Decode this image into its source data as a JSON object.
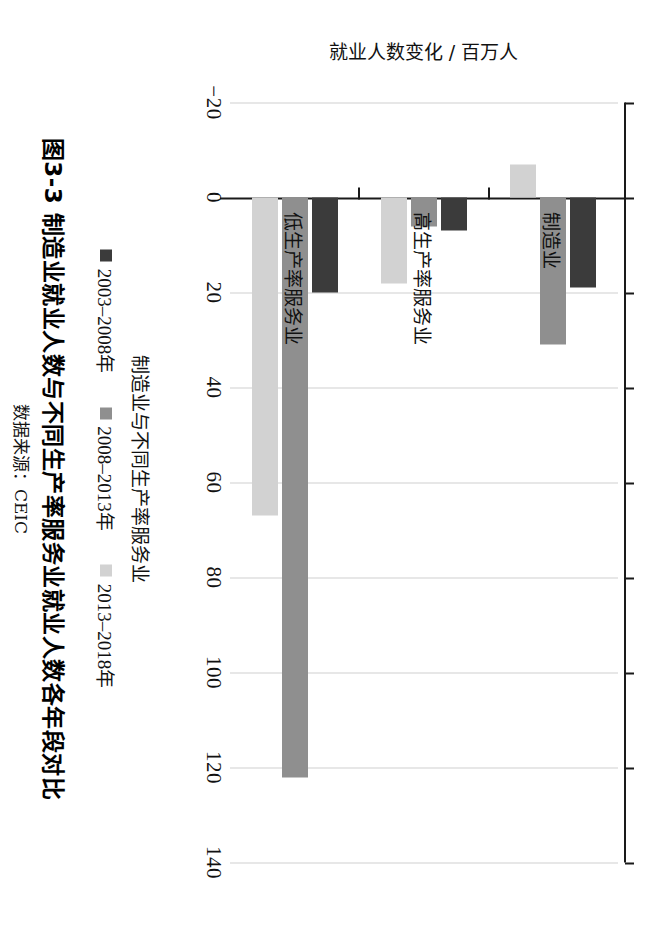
{
  "figure": {
    "number": "图3-3",
    "title": "图3-3  制造业就业人数与不同生产率服务业就业人数各年段对比",
    "source": "数据来源：CEIC"
  },
  "chart_data": {
    "type": "bar",
    "orientation": "vertical",
    "title": "制造业就业人数与不同生产率服务业就业人数各年段对比",
    "xlabel": "制造业与不同生产率服务业",
    "ylabel": "就业人数变化 / 百万人",
    "categories": [
      "制造业",
      "高生产率服务业",
      "低生产率服务业"
    ],
    "series": [
      {
        "name": "2003–2008年",
        "color": "#3b3b3b",
        "values": [
          19,
          7,
          20
        ]
      },
      {
        "name": "2008–2013年",
        "color": "#8f8f8f",
        "values": [
          31,
          6,
          122
        ]
      },
      {
        "name": "2013–2018年",
        "color": "#d2d2d2",
        "values": [
          -7,
          18,
          67
        ]
      }
    ],
    "ylim": [
      -20,
      140
    ],
    "yticks": [
      -20,
      0,
      20,
      40,
      60,
      80,
      100,
      120,
      140
    ],
    "ytick_labels": [
      "−20",
      "0",
      "20",
      "40",
      "60",
      "80",
      "100",
      "120",
      "140"
    ],
    "grid": true,
    "legend_position": "bottom"
  },
  "axis": {
    "value_axis_title": "就业人数变化 / 百万人",
    "category_axis_title": "制造业与不同生产率服务业"
  }
}
